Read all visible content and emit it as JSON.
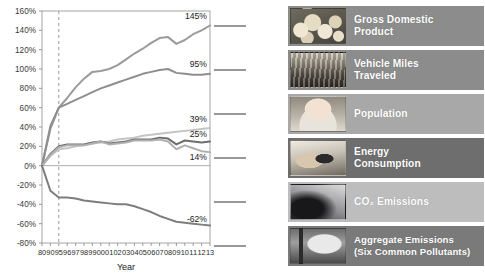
{
  "chart_data": {
    "type": "line",
    "title": "",
    "xlabel": "Year",
    "ylabel": "",
    "ylim": [
      -80,
      160
    ],
    "ytick_labels": [
      "160%",
      "140%",
      "120%",
      "100%",
      "80%",
      "60%",
      "40%",
      "20%",
      "0%",
      "-20%",
      "-40%",
      "-60%",
      "-80%"
    ],
    "ytick_values": [
      160,
      140,
      120,
      100,
      80,
      60,
      40,
      20,
      0,
      -20,
      -40,
      -60,
      -80
    ],
    "grid": false,
    "legend_position": "right",
    "reference_line_year": "95",
    "x": [
      "80",
      "90",
      "95",
      "96",
      "97",
      "98",
      "99",
      "00",
      "01",
      "02",
      "03",
      "04",
      "05",
      "06",
      "07",
      "08",
      "09",
      "10",
      "11",
      "12",
      "13"
    ],
    "xtick_labels": [
      "80",
      "90",
      "95",
      "96",
      "97",
      "98",
      "99",
      "00",
      "01",
      "02",
      "03",
      "04",
      "05",
      "06",
      "07",
      "08",
      "09",
      "10",
      "11",
      "12",
      "13"
    ],
    "series": [
      {
        "name": "Gross Domestic Product",
        "color": "#9a9a9a",
        "end_label": "145%",
        "values": [
          0,
          38,
          60,
          70,
          81,
          90,
          97,
          98,
          100,
          104,
          110,
          116,
          121,
          127,
          132,
          133,
          126,
          130,
          136,
          140,
          145
        ]
      },
      {
        "name": "Vehicle Miles Traveled",
        "color": "#8e8e8e",
        "end_label": "95%",
        "values": [
          0,
          41,
          60,
          64,
          68,
          72,
          76,
          80,
          83,
          86,
          89,
          92,
          95,
          97,
          99,
          100,
          96,
          95,
          94,
          94,
          95
        ]
      },
      {
        "name": "Population",
        "color": "#c4c4c4",
        "end_label": "39%",
        "values": [
          0,
          10,
          17,
          18,
          20,
          21,
          23,
          24,
          25,
          27,
          28,
          29,
          31,
          32,
          33,
          34,
          35,
          36,
          37,
          38,
          39
        ]
      },
      {
        "name": "Energy Consumption",
        "color": "#6e6e6e",
        "end_label": "25%",
        "values": [
          0,
          12,
          20,
          22,
          22,
          22,
          24,
          25,
          23,
          24,
          25,
          27,
          27,
          27,
          29,
          28,
          22,
          26,
          25,
          24,
          25
        ]
      },
      {
        "name": "CO2 Emissions",
        "color": "#b0b0b0",
        "end_label": "14%",
        "values": [
          0,
          11,
          19,
          21,
          21,
          21,
          23,
          25,
          22,
          23,
          24,
          26,
          26,
          26,
          27,
          25,
          17,
          21,
          18,
          15,
          14
        ]
      },
      {
        "name": "Aggregate Emissions (Six Common Pollutants)",
        "color": "#7d7d7d",
        "end_label": "-62%",
        "values": [
          0,
          -26,
          -33,
          -33,
          -34,
          -36,
          -37,
          -38,
          -39,
          -40,
          -40,
          -42,
          -45,
          -48,
          -52,
          -55,
          -58,
          -59,
          -60,
          -61,
          -62
        ]
      }
    ]
  },
  "legend": {
    "items": [
      {
        "label_line1": "Gross Domestic",
        "label_line2": "Product",
        "icon": "coins-photo-icon",
        "bar_color": "#8c8c8c",
        "text_color": "#ffffff"
      },
      {
        "label_line1": "Vehicle Miles",
        "label_line2": "Traveled",
        "icon": "traffic-photo-icon",
        "bar_color": "#8c8c8c",
        "text_color": "#ffffff"
      },
      {
        "label_line1": "Population",
        "label_line2": "",
        "icon": "baby-photo-icon",
        "bar_color": "#a8a8a8",
        "text_color": "#ffffff"
      },
      {
        "label_line1": "Energy",
        "label_line2": "Consumption",
        "icon": "plug-photo-icon",
        "bar_color": "#6e6e6e",
        "text_color": "#ffffff"
      },
      {
        "label_line1": "CO₂ Emissions",
        "label_line2": "",
        "icon": "smokestack-photo-icon",
        "bar_color": "#bdbdbd",
        "text_color": "#ffffff"
      },
      {
        "label_line1": "Aggregate Emissions",
        "label_line2": "(Six Common Pollutants)",
        "icon": "industrial-stack-photo-icon",
        "bar_color": "#7a7a7a",
        "text_color": "#ffffff"
      }
    ]
  }
}
